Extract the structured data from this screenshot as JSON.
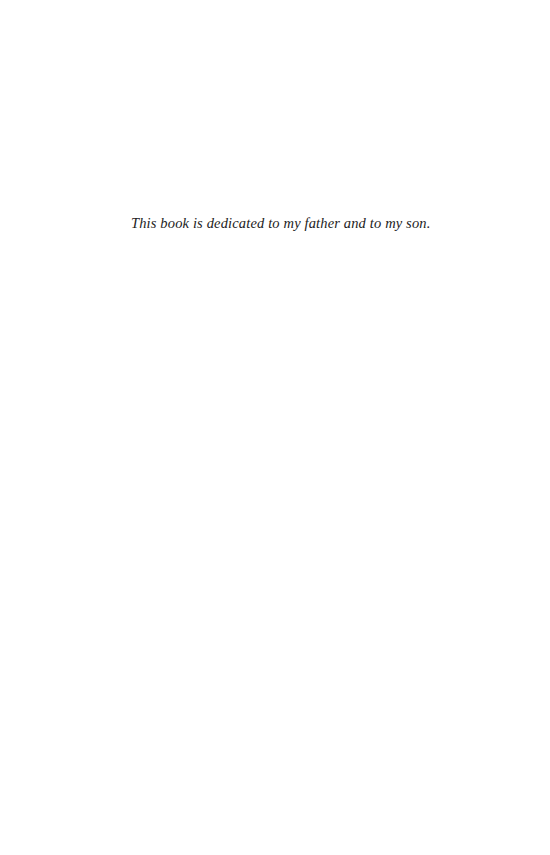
{
  "page": {
    "dedication": "This book is dedicated to my father and to my son."
  }
}
